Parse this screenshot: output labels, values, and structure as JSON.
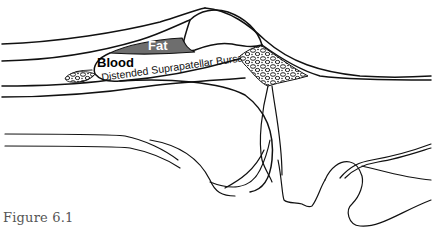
{
  "diagram": {
    "labels": {
      "fat": "Fat",
      "blood": "Blood",
      "bursa": "Distended Suprapatellar Bursa"
    },
    "colors": {
      "fat_fill": "#6e6e6e",
      "line": "#111111",
      "background": "#ffffff"
    }
  },
  "caption": "Figure 6.1"
}
